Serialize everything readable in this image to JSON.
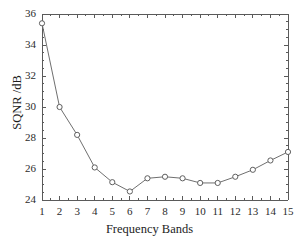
{
  "chart_data": {
    "type": "line",
    "title": "",
    "subtitle": "",
    "xlabel": "Frequency Bands",
    "ylabel": "SQNR /dB",
    "x": [
      1,
      2,
      3,
      4,
      5,
      6,
      7,
      8,
      9,
      10,
      11,
      12,
      13,
      14,
      15
    ],
    "categories": [
      "1",
      "2",
      "3",
      "4",
      "5",
      "6",
      "7",
      "8",
      "9",
      "10",
      "11",
      "12",
      "13",
      "14",
      "15"
    ],
    "values": [
      35.4,
      30.0,
      28.2,
      26.1,
      25.15,
      24.55,
      25.4,
      25.5,
      25.4,
      25.1,
      25.1,
      25.5,
      25.95,
      26.55,
      27.1
    ],
    "series": [
      {
        "name": "SQNR",
        "values": [
          35.4,
          30.0,
          28.2,
          26.1,
          25.15,
          24.55,
          25.4,
          25.5,
          25.4,
          25.1,
          25.1,
          25.5,
          25.95,
          26.55,
          27.1
        ]
      }
    ],
    "xlim": [
      1,
      15
    ],
    "ylim": [
      24,
      36
    ],
    "ytick_labels": [
      "24",
      "26",
      "28",
      "30",
      "32",
      "34",
      "36"
    ],
    "ytick_values": [
      24,
      26,
      28,
      30,
      32,
      34,
      36
    ],
    "xtick_labels": [
      "1",
      "2",
      "3",
      "4",
      "5",
      "6",
      "7",
      "8",
      "9",
      "10",
      "11",
      "12",
      "13",
      "14",
      "15"
    ],
    "xtick_values": [
      1,
      2,
      3,
      4,
      5,
      6,
      7,
      8,
      9,
      10,
      11,
      12,
      13,
      14,
      15
    ],
    "grid": false,
    "legend": false,
    "legend_position": "none",
    "marker": "circle-open",
    "line_color": "#6f6f6f",
    "marker_fill": "#ffffff",
    "marker_stroke": "#5f5f5f",
    "axis_color": "#5a5a5a",
    "background": "#ffffff",
    "annotations": []
  }
}
